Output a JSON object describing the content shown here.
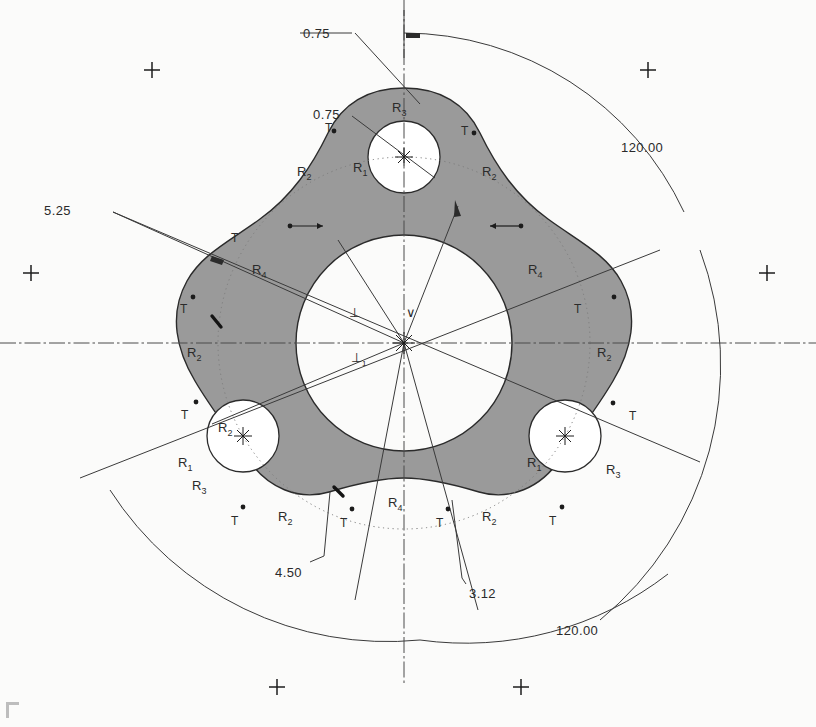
{
  "drawing": {
    "title": "Three-lobe rotor plate CAD sketch",
    "background_color": "#fbfbfa",
    "body_fill_color": "#9a9a9a",
    "line_color": "#2b2b2b",
    "construction_color": "#6e6e6e"
  },
  "dimensions": [
    {
      "id": "d-top-075",
      "label": "0.75",
      "x": 303,
      "y": 26
    },
    {
      "id": "d-inner-075",
      "label": "0.75",
      "x": 313,
      "y": 107
    },
    {
      "id": "d-left-525",
      "label": "5.25",
      "x": 44,
      "y": 203
    },
    {
      "id": "d-bottom-450",
      "label": "4.50",
      "x": 275,
      "y": 565
    },
    {
      "id": "d-bottom-312",
      "label": "3.12",
      "x": 469,
      "y": 586
    },
    {
      "id": "d-angle-top",
      "label": "120.00",
      "x": 621,
      "y": 140
    },
    {
      "id": "d-angle-bottom",
      "label": "120.00",
      "x": 556,
      "y": 623
    }
  ],
  "radius_labels": [
    {
      "id": "r3-top",
      "base": "R",
      "sub": "3",
      "x": 392,
      "y": 100
    },
    {
      "id": "r1-top",
      "base": "R",
      "sub": "1",
      "x": 353,
      "y": 160
    },
    {
      "id": "r2-top-left",
      "base": "R",
      "sub": "2",
      "x": 297,
      "y": 164
    },
    {
      "id": "r2-top-right",
      "base": "R",
      "sub": "2",
      "x": 482,
      "y": 164
    },
    {
      "id": "r4-left",
      "base": "R",
      "sub": "4",
      "x": 252,
      "y": 262
    },
    {
      "id": "r4-right",
      "base": "R",
      "sub": "4",
      "x": 528,
      "y": 262
    },
    {
      "id": "r2-mid-left",
      "base": "R",
      "sub": "2",
      "x": 187,
      "y": 345
    },
    {
      "id": "r2-mid-right",
      "base": "R",
      "sub": "2",
      "x": 597,
      "y": 345
    },
    {
      "id": "r2-bl-hole",
      "base": "R",
      "sub": "2",
      "x": 218,
      "y": 420
    },
    {
      "id": "r1-bl",
      "base": "R",
      "sub": "1",
      "x": 178,
      "y": 455
    },
    {
      "id": "r3-bl",
      "base": "R",
      "sub": "3",
      "x": 192,
      "y": 478
    },
    {
      "id": "r1-br",
      "base": "R",
      "sub": "1",
      "x": 527,
      "y": 455
    },
    {
      "id": "r3-br",
      "base": "R",
      "sub": "3",
      "x": 606,
      "y": 462
    },
    {
      "id": "r4-bottom",
      "base": "R",
      "sub": "4",
      "x": 388,
      "y": 495
    },
    {
      "id": "r2-bottom-left",
      "base": "R",
      "sub": "2",
      "x": 278,
      "y": 509
    },
    {
      "id": "r2-bottom-right",
      "base": "R",
      "sub": "2",
      "x": 482,
      "y": 509
    }
  ],
  "tangent_marks": [
    {
      "id": "t-top-left",
      "label": "T",
      "x": 325,
      "y": 121
    },
    {
      "id": "t-top-right",
      "label": "T",
      "x": 461,
      "y": 124
    },
    {
      "id": "t-upper-left",
      "label": "T",
      "x": 231,
      "y": 231
    },
    {
      "id": "t-mid-left",
      "label": "T",
      "x": 180,
      "y": 302
    },
    {
      "id": "t-mid-right",
      "label": "T",
      "x": 574,
      "y": 302
    },
    {
      "id": "t-low-left",
      "label": "T",
      "x": 181,
      "y": 408
    },
    {
      "id": "t-low-right",
      "label": "T",
      "x": 629,
      "y": 409
    },
    {
      "id": "t-bot-left",
      "label": "T",
      "x": 231,
      "y": 514
    },
    {
      "id": "t-bot-mid-l",
      "label": "T",
      "x": 340,
      "y": 516
    },
    {
      "id": "t-bot-mid-r",
      "label": "T",
      "x": 436,
      "y": 516
    },
    {
      "id": "t-bot-right",
      "label": "T",
      "x": 549,
      "y": 514
    }
  ],
  "constraints": [
    {
      "id": "perp-upper",
      "glyph": "⊥",
      "sub": "",
      "x": 349,
      "y": 305
    },
    {
      "id": "perp-lower",
      "glyph": "⊥",
      "sub": "1",
      "x": 351,
      "y": 350
    },
    {
      "id": "vee-mark",
      "glyph": "∨",
      "sub": "",
      "x": 406,
      "y": 305
    }
  ],
  "geometry": {
    "center": {
      "x": 404,
      "y": 343
    },
    "central_bore_radius": 108,
    "bolt_hole_radius": 25,
    "bolt_circle_radius": 186,
    "outer_construction_radius": 248,
    "angle_arc_outer_radius": 330,
    "angle_arc_inner_radius": 290
  },
  "registration_marks": [
    {
      "id": "cross-top-left",
      "x": 152,
      "y": 70
    },
    {
      "id": "cross-top-right",
      "x": 648,
      "y": 70
    },
    {
      "id": "cross-mid-left",
      "x": 31,
      "y": 273
    },
    {
      "id": "cross-mid-right",
      "x": 767,
      "y": 273
    },
    {
      "id": "cross-bottom-left",
      "x": 277,
      "y": 687
    },
    {
      "id": "cross-bottom-right",
      "x": 521,
      "y": 687
    }
  ]
}
